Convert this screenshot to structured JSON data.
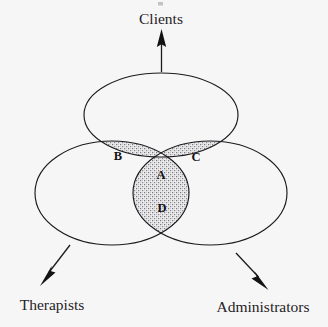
{
  "diagram": {
    "type": "venn-three-set",
    "title": "",
    "background_color": "#f7f6f7",
    "line_color": "#1c1a1c",
    "shade_color": "#b9b6b9",
    "sets": [
      {
        "id": "clients",
        "label": "Clients",
        "position": "top",
        "arrow": "up",
        "center": [
          161,
          115
        ],
        "radii": [
          77,
          42
        ]
      },
      {
        "id": "therapists",
        "label": "Therapists",
        "position": "bottom-left",
        "arrow": "down-left",
        "center": [
          112,
          193
        ],
        "radii": [
          77,
          52
        ]
      },
      {
        "id": "administrators",
        "label": "Administrators",
        "position": "bottom-right",
        "arrow": "down-right",
        "center": [
          210,
          193
        ],
        "radii": [
          77,
          52
        ]
      }
    ],
    "regions": [
      {
        "id": "A",
        "letter": "A",
        "shaded": false,
        "members": [
          "clients",
          "therapists",
          "administrators"
        ],
        "label_xy": [
          161,
          176
        ]
      },
      {
        "id": "B",
        "letter": "B",
        "shaded": true,
        "members": [
          "clients",
          "therapists"
        ],
        "label_xy": [
          118,
          157
        ]
      },
      {
        "id": "C",
        "letter": "C",
        "shaded": true,
        "members": [
          "clients",
          "administrators"
        ],
        "label_xy": [
          196,
          158
        ]
      },
      {
        "id": "D",
        "letter": "D",
        "shaded": true,
        "members": [
          "therapists",
          "administrators"
        ],
        "label_xy": [
          162,
          209
        ]
      }
    ],
    "labels": {
      "top": "Clients",
      "bottom_left": "Therapists",
      "bottom_right": "Administrators"
    },
    "label_positions": {
      "top": [
        161,
        24
      ],
      "bottom_left": [
        52,
        310
      ],
      "bottom_right": [
        263,
        312
      ]
    }
  }
}
